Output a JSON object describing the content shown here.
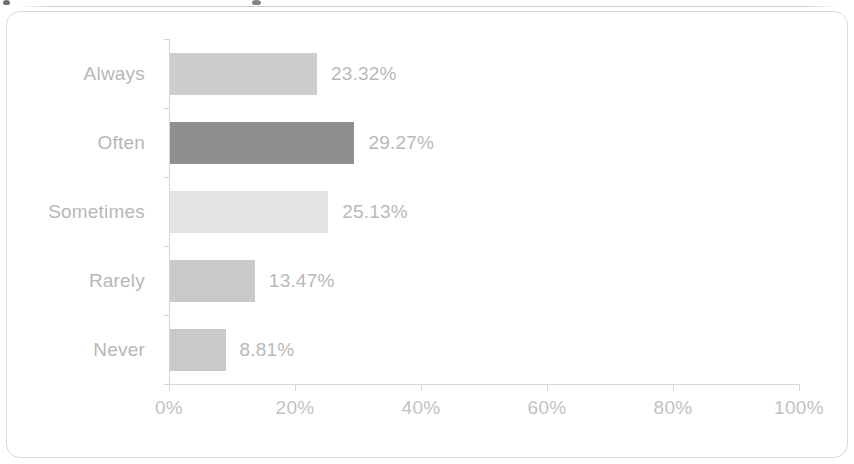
{
  "frame": {
    "border_color": "#d9d9d9",
    "background": "#ffffff"
  },
  "cutoff_artifacts": {
    "present": true,
    "description": "faint clipped glyph remnants along the very top edge"
  },
  "chart_data": {
    "type": "bar",
    "orientation": "horizontal",
    "title": "",
    "subtitle": "",
    "xlabel": "",
    "ylabel": "",
    "categories": [
      "Always",
      "Often",
      "Sometimes",
      "Rarely",
      "Never"
    ],
    "values": [
      23.32,
      29.27,
      25.13,
      13.47,
      8.81
    ],
    "value_labels": [
      "23.32%",
      "29.27%",
      "25.13%",
      "13.47%",
      "8.81%"
    ],
    "bar_colors": [
      "#cdcdcd",
      "#8f8f8f",
      "#e4e4e4",
      "#c9c9c9",
      "#c9c9c9"
    ],
    "xlim": [
      0,
      100
    ],
    "xticks": [
      0,
      20,
      40,
      60,
      80,
      100
    ],
    "xticklabels": [
      "0%",
      "20%",
      "40%",
      "60%",
      "80%",
      "100%"
    ],
    "grid": false,
    "legend": false,
    "legend_position": "none",
    "axis_color": "#d6d6d6",
    "label_color": "#b7b7b7",
    "value_label_color": "#b9b9b9",
    "tick_label_color": "#c2c2c2"
  }
}
